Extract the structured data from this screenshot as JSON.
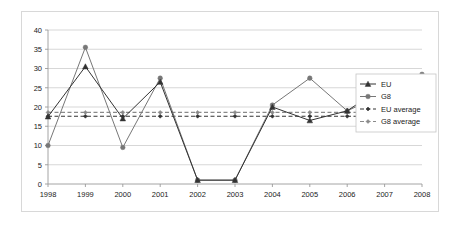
{
  "chart_data": {
    "type": "line",
    "title": "",
    "subtitle": "",
    "xlabel": "",
    "ylabel": "",
    "categories": [
      "1998",
      "1999",
      "2000",
      "2001",
      "2002",
      "2003",
      "2004",
      "2005",
      "2006",
      "2007",
      "2008"
    ],
    "x_tick_labels": [
      "1998",
      "1999",
      "2000",
      "2001",
      "2002",
      "2003",
      "2004",
      "2005",
      "2006",
      "2007",
      "2008"
    ],
    "y_tick_labels": [
      "0",
      "5",
      "10",
      "15",
      "20",
      "25",
      "30",
      "35",
      "40"
    ],
    "y_ticks": [
      0,
      5,
      10,
      15,
      20,
      25,
      30,
      35,
      40
    ],
    "ylim": [
      0,
      40
    ],
    "grid": true,
    "grid_axis": "y",
    "legend_position": "right",
    "series": [
      {
        "name": "EU",
        "style": "solid",
        "marker": "triangle",
        "color": "#333333",
        "values": [
          17.5,
          30.5,
          17.0,
          26.5,
          1.0,
          1.0,
          20.0,
          16.5,
          19.0,
          25.5,
          26.5
        ]
      },
      {
        "name": "G8",
        "style": "solid",
        "marker": "circle",
        "color": "#777777",
        "values": [
          10.0,
          35.5,
          9.5,
          27.5,
          1.0,
          1.0,
          20.5,
          27.5,
          19.0,
          23.5,
          28.5
        ]
      },
      {
        "name": "EU average",
        "style": "dashed",
        "marker": "diamond",
        "color": "#333333",
        "constant": 17.6,
        "values": [
          17.6,
          17.6,
          17.6,
          17.6,
          17.6,
          17.6,
          17.6,
          17.6,
          17.6,
          17.6,
          17.6
        ]
      },
      {
        "name": "G8 average",
        "style": "dashed",
        "marker": "diamond",
        "color": "#8a8a8a",
        "constant": 18.6,
        "values": [
          18.6,
          18.6,
          18.6,
          18.6,
          18.6,
          18.6,
          18.6,
          18.6,
          18.6,
          18.6,
          18.6
        ]
      }
    ],
    "legend": [
      {
        "label": "EU",
        "color": "#333333",
        "marker": "triangle",
        "style": "solid"
      },
      {
        "label": "G8",
        "color": "#777777",
        "marker": "circle",
        "style": "solid"
      },
      {
        "label": "EU average",
        "color": "#333333",
        "marker": "diamond",
        "style": "dashed"
      },
      {
        "label": "G8 average",
        "color": "#8a8a8a",
        "marker": "diamond",
        "style": "dashed"
      }
    ]
  },
  "colors": {
    "eu": "#333333",
    "g8": "#777777",
    "eu_average": "#333333",
    "g8_average": "#8a8a8a",
    "grid": "#c6c6c6",
    "axis": "#9a9a9a",
    "frame": "#d8d8d8",
    "background": "#ffffff"
  }
}
